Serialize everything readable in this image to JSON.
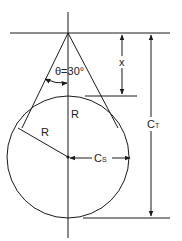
{
  "diagram": {
    "type": "geometry",
    "labels": {
      "angle": "θ=30°",
      "x": "x",
      "radius_diag": "R",
      "radius_vert": "R",
      "cs_main": "C",
      "cs_sub": "S",
      "ct_main": "C",
      "ct_sub": "T"
    },
    "colors": {
      "stroke": "#1a1a1a",
      "background": "#ffffff"
    }
  }
}
